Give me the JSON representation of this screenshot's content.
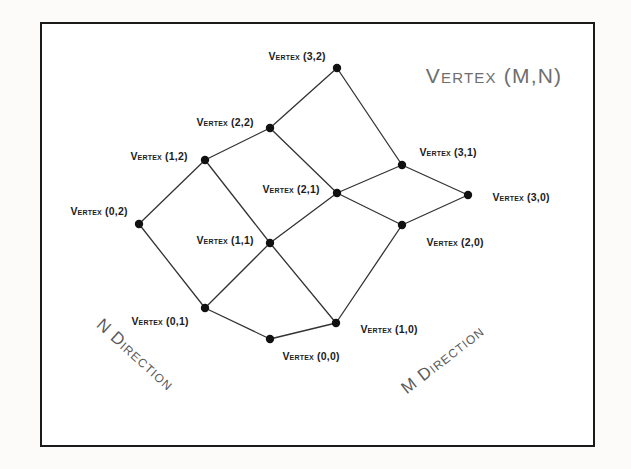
{
  "figure": {
    "title": "Vertex (M,N)",
    "frame": {
      "x": 40,
      "y": 22,
      "width": 555,
      "height": 425
    },
    "direction_labels": {
      "n": {
        "text": "N Direction",
        "x": 135,
        "y": 355,
        "rotation": 42
      },
      "m": {
        "text": "M Direction",
        "x": 443,
        "y": 360,
        "rotation": -38
      }
    },
    "title_position": {
      "x": 494,
      "y": 76
    }
  },
  "chart_data": {
    "type": "diagram",
    "title": "Vertex (M,N)",
    "grid": {
      "m_count": 4,
      "n_count": 3,
      "m_range": [
        0,
        3
      ],
      "n_range": [
        0,
        2
      ]
    },
    "axes": {
      "m_direction": "M Direction",
      "n_direction": "N Direction"
    },
    "vertices": [
      {
        "id": "v00",
        "m": 0,
        "n": 0,
        "label": "Vertex (0,0)",
        "x": 270,
        "y": 339,
        "label_x": 311,
        "label_y": 356
      },
      {
        "id": "v10",
        "m": 1,
        "n": 0,
        "label": "Vertex (1,0)",
        "x": 336,
        "y": 323,
        "label_x": 389,
        "label_y": 329
      },
      {
        "id": "v20",
        "m": 2,
        "n": 0,
        "label": "Vertex (2,0)",
        "x": 402,
        "y": 225,
        "label_x": 455,
        "label_y": 242
      },
      {
        "id": "v30",
        "m": 3,
        "n": 0,
        "label": "Vertex (3,0)",
        "x": 468,
        "y": 195,
        "label_x": 521,
        "label_y": 197
      },
      {
        "id": "v01",
        "m": 0,
        "n": 1,
        "label": "Vertex (0,1)",
        "x": 205,
        "y": 308,
        "label_x": 160,
        "label_y": 321
      },
      {
        "id": "v11",
        "m": 1,
        "n": 1,
        "label": "Vertex (1,1)",
        "x": 270,
        "y": 243,
        "label_x": 225,
        "label_y": 240
      },
      {
        "id": "v21",
        "m": 2,
        "n": 1,
        "label": "Vertex (2,1)",
        "x": 337,
        "y": 193,
        "label_x": 291,
        "label_y": 189
      },
      {
        "id": "v31",
        "m": 3,
        "n": 1,
        "label": "Vertex (3,1)",
        "x": 402,
        "y": 165,
        "label_x": 448,
        "label_y": 152
      },
      {
        "id": "v02",
        "m": 0,
        "n": 2,
        "label": "Vertex (0,2)",
        "x": 139,
        "y": 224,
        "label_x": 99,
        "label_y": 211
      },
      {
        "id": "v12",
        "m": 1,
        "n": 2,
        "label": "Vertex (1,2)",
        "x": 205,
        "y": 160,
        "label_x": 159,
        "label_y": 156
      },
      {
        "id": "v22",
        "m": 2,
        "n": 2,
        "label": "Vertex (2,2)",
        "x": 270,
        "y": 128,
        "label_x": 225,
        "label_y": 122
      },
      {
        "id": "v32",
        "m": 3,
        "n": 2,
        "label": "Vertex (3,2)",
        "x": 337,
        "y": 68,
        "label_x": 297,
        "label_y": 56
      }
    ],
    "edges": [
      [
        "v00",
        "v10"
      ],
      [
        "v10",
        "v20"
      ],
      [
        "v20",
        "v30"
      ],
      [
        "v01",
        "v11"
      ],
      [
        "v11",
        "v21"
      ],
      [
        "v21",
        "v31"
      ],
      [
        "v02",
        "v12"
      ],
      [
        "v12",
        "v22"
      ],
      [
        "v22",
        "v32"
      ],
      [
        "v00",
        "v01"
      ],
      [
        "v01",
        "v02"
      ],
      [
        "v10",
        "v11"
      ],
      [
        "v11",
        "v12"
      ],
      [
        "v20",
        "v21"
      ],
      [
        "v21",
        "v22"
      ],
      [
        "v30",
        "v31"
      ],
      [
        "v31",
        "v32"
      ]
    ],
    "style": {
      "dot_color": "#111111",
      "line_color": "#333333",
      "dot_radius": 4.2,
      "line_width": 1.3
    }
  }
}
